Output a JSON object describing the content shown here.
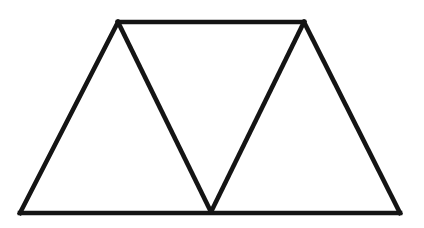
{
  "figure": {
    "kind": "line-drawing",
    "canvas": {
      "width": 424,
      "height": 228,
      "background_color": "#ffffff"
    },
    "style": {
      "stroke_color": "#141414",
      "stroke_width": 4.6,
      "fill": "none",
      "line_cap": "square",
      "line_join": "miter"
    },
    "vertices": {
      "bottom_left": {
        "label": "bottom-left",
        "x": 20,
        "y": 213
      },
      "bottom_middle": {
        "label": "bottom-middle-valley",
        "x": 211,
        "y": 212
      },
      "bottom_right": {
        "label": "bottom-right",
        "x": 400,
        "y": 213
      },
      "top_left": {
        "label": "top-left-apex",
        "x": 118,
        "y": 22
      },
      "top_right": {
        "label": "top-right-apex",
        "x": 304,
        "y": 22
      }
    },
    "segments": [
      {
        "name": "bottom-edge",
        "from": "bottom_left",
        "to": "bottom_right",
        "points": "20,213 400,213"
      },
      {
        "name": "top-edge",
        "from": "top_left",
        "to": "top_right",
        "points": "118,22 304,22"
      },
      {
        "name": "left-outer-diagonal",
        "from": "bottom_left",
        "to": "top_left",
        "points": "20,213 118,22"
      },
      {
        "name": "inner-left-diagonal",
        "from": "top_left",
        "to": "bottom_middle",
        "points": "118,22 211,212"
      },
      {
        "name": "inner-right-diagonal",
        "from": "bottom_middle",
        "to": "top_right",
        "points": "211,212 304,22"
      },
      {
        "name": "right-outer-diagonal",
        "from": "top_right",
        "to": "bottom_right",
        "points": "304,22 400,213"
      }
    ],
    "paths": {
      "outline": "M20,213 L118,22 L304,22 L400,213 Z",
      "zigzag": "M118,22 L211,212 L304,22"
    },
    "regions": [
      {
        "name": "left-triangle",
        "orientation": "up",
        "vertices": [
          "bottom_left",
          "top_left",
          "bottom_middle"
        ]
      },
      {
        "name": "center-triangle",
        "orientation": "down",
        "vertices": [
          "top_left",
          "top_right",
          "bottom_middle"
        ]
      },
      {
        "name": "right-triangle",
        "orientation": "up",
        "vertices": [
          "bottom_middle",
          "top_right",
          "bottom_right"
        ]
      }
    ]
  }
}
